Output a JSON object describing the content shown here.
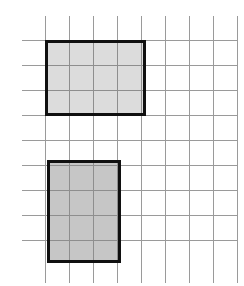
{
  "figure": {
    "width": 244,
    "height": 286,
    "background_color": "#ffffff"
  },
  "grid": {
    "line_color": "#9a9a9a",
    "line_width": 1,
    "cell_width": 24,
    "cell_height": 25,
    "vertical_count": 9,
    "horizontal_count": 9,
    "vertical_x": [
      45,
      69,
      93,
      117,
      141,
      165,
      189,
      213,
      237
    ],
    "horizontal_y": [
      40,
      65,
      90,
      115,
      140,
      165,
      190,
      215,
      240
    ],
    "vertical_extent": {
      "top": 16,
      "bottom": 283
    },
    "horizontal_extent": {
      "left": 22,
      "right": 238
    }
  },
  "shapes": [
    {
      "name": "top-rectangle",
      "label": "upper shaded rectangle",
      "x": 45,
      "y": 40,
      "width": 101,
      "height": 76,
      "cells_wide": 4,
      "cells_tall": 3,
      "area_cells": 12,
      "fill_color": "#dcdcdc",
      "stroke_color": "#101010",
      "stroke_width": 3
    },
    {
      "name": "bottom-rectangle",
      "label": "lower shaded rectangle",
      "x": 47,
      "y": 160,
      "width": 74,
      "height": 103,
      "cells_wide": 3,
      "cells_tall": 4,
      "area_cells": 12,
      "fill_color": "#c6c6c6",
      "stroke_color": "#101010",
      "stroke_width": 3
    }
  ],
  "chart_data": {
    "type": "diagram",
    "grid_unit": "1 square",
    "shapes": [
      {
        "name": "upper shaded rectangle",
        "width_units": 4,
        "height_units": 3,
        "area_units": 12,
        "perimeter_units": 14
      },
      {
        "name": "lower shaded rectangle",
        "width_units": 3,
        "height_units": 4,
        "area_units": 12,
        "perimeter_units": 14
      }
    ]
  }
}
